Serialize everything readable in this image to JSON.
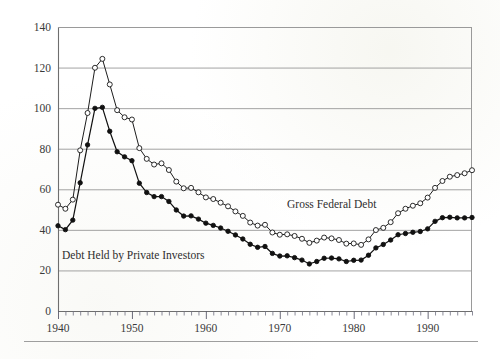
{
  "figure": {
    "background_color": "#ffffff",
    "has_bottom_rule": true
  },
  "chart_data": {
    "type": "line",
    "title": "",
    "subtitle": "",
    "xlabel": "",
    "ylabel": "",
    "grid": true,
    "grid_axis": "y",
    "legend_position": "inline-annotation",
    "xlim": [
      1940,
      1996
    ],
    "ylim": [
      0,
      140
    ],
    "ytick_labels": [
      "0",
      "20",
      "40",
      "60",
      "80",
      "100",
      "120",
      "140"
    ],
    "ytick_values": [
      0,
      20,
      40,
      60,
      80,
      100,
      120,
      140
    ],
    "xtick_labels": [
      "1940",
      "1950",
      "1960",
      "1970",
      "1980",
      "1990"
    ],
    "xtick_values": [
      1940,
      1950,
      1960,
      1970,
      1980,
      1990
    ],
    "x_minor_tick_interval": 1,
    "x": [
      1940,
      1941,
      1942,
      1943,
      1944,
      1945,
      1946,
      1947,
      1948,
      1949,
      1950,
      1951,
      1952,
      1953,
      1954,
      1955,
      1956,
      1957,
      1958,
      1959,
      1960,
      1961,
      1962,
      1963,
      1964,
      1965,
      1966,
      1967,
      1968,
      1969,
      1970,
      1971,
      1972,
      1973,
      1974,
      1975,
      1976,
      1977,
      1978,
      1979,
      1980,
      1981,
      1982,
      1983,
      1984,
      1985,
      1986,
      1987,
      1988,
      1989,
      1990,
      1991,
      1992,
      1993,
      1994,
      1995,
      1996
    ],
    "series": [
      {
        "name": "Gross Federal Debt",
        "marker": "open-circle",
        "color": "#1d1d1d",
        "values": [
          52.4,
          50.4,
          54.9,
          79.2,
          97.6,
          119.9,
          124.3,
          111.7,
          99.0,
          95.5,
          94.4,
          80.3,
          75.0,
          72.2,
          72.8,
          69.5,
          63.8,
          60.5,
          60.7,
          58.5,
          56.0,
          55.2,
          53.4,
          51.6,
          49.1,
          46.9,
          43.6,
          42.1,
          42.5,
          38.7,
          37.6,
          37.8,
          37.0,
          35.6,
          33.6,
          34.7,
          36.2,
          35.8,
          35.0,
          33.2,
          33.3,
          32.6,
          35.3,
          39.9,
          41.0,
          43.8,
          48.2,
          50.4,
          51.9,
          53.1,
          55.9,
          60.7,
          64.1,
          66.2,
          67.0,
          67.9,
          69.4
        ]
      },
      {
        "name": "Debt Held by Private Investors",
        "marker": "filled-circle",
        "color": "#111111",
        "values": [
          42.0,
          40.1,
          44.8,
          63.2,
          81.9,
          99.9,
          100.4,
          88.6,
          78.5,
          76.0,
          74.1,
          63.0,
          58.4,
          56.4,
          56.4,
          54.0,
          49.8,
          46.8,
          46.9,
          45.3,
          43.3,
          42.2,
          40.9,
          39.3,
          37.5,
          35.5,
          32.9,
          31.4,
          31.8,
          28.4,
          27.1,
          27.2,
          26.3,
          25.1,
          23.2,
          24.4,
          26.0,
          26.1,
          25.7,
          24.4,
          25.0,
          25.1,
          27.5,
          31.1,
          32.8,
          35.0,
          37.6,
          38.2,
          38.8,
          39.2,
          40.5,
          44.2,
          46.0,
          46.2,
          45.9,
          45.9,
          46.1
        ]
      }
    ],
    "annotations": [
      {
        "name": "gross-federal-debt-label",
        "text": "Gross Federal Debt",
        "x_px": 287,
        "y_px": 208
      },
      {
        "name": "debt-held-by-private-investors-label",
        "text": "Debt Held by Private Investors",
        "x_px": 62,
        "y_px": 259
      }
    ]
  }
}
